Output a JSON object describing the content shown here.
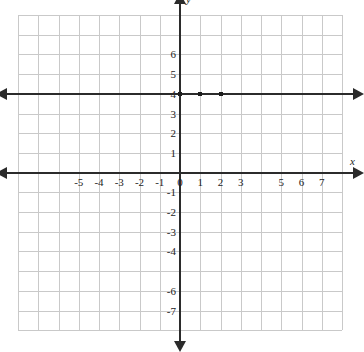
{
  "chart_data": {
    "type": "line",
    "title": "",
    "xlabel": "x",
    "ylabel": "y",
    "grid": true,
    "legend": null,
    "xlim": [
      -8,
      8
    ],
    "ylim": [
      -8,
      8
    ],
    "x_tick_labels": [
      "-5",
      "-4",
      "-3",
      "-2",
      "-1",
      "0",
      "1",
      "2",
      "3",
      "5",
      "6",
      "7"
    ],
    "x_tick_values": [
      -5,
      -4,
      -3,
      -2,
      -1,
      0,
      1,
      2,
      3,
      5,
      6,
      7
    ],
    "y_tick_labels": [
      "6",
      "5",
      "4",
      "3",
      "2",
      "1",
      "-1",
      "-2",
      "-3",
      "-4",
      "-6",
      "-7"
    ],
    "y_tick_values": [
      6,
      5,
      4,
      3,
      2,
      1,
      -1,
      -2,
      -3,
      -4,
      -6,
      -7
    ],
    "series": [
      {
        "name": "y = 4",
        "equation": "y = 4",
        "type": "horizontal-line",
        "y_value": 4,
        "arrows": "both",
        "points": [
          {
            "x": 0,
            "y": 4
          },
          {
            "x": 1,
            "y": 4
          },
          {
            "x": 2,
            "y": 4
          }
        ]
      }
    ],
    "colors": {
      "line": "#2b2b2b",
      "axis": "#2b2b2b",
      "grid": "#c9c9c9",
      "marker": "#1d1d1d",
      "background": "#ffffff"
    }
  },
  "axes": {
    "x_axis_name": "x",
    "y_axis_name": "y"
  }
}
